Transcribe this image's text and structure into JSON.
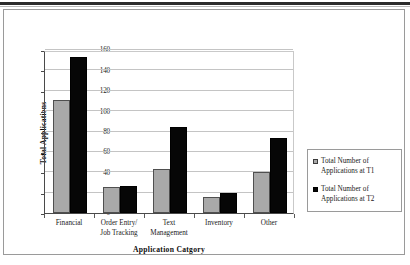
{
  "figure": {
    "y_axis_title": "Total Applications",
    "x_axis_title": "Application Catgory"
  },
  "legend": {
    "items": [
      {
        "label_line1": "Total Number of",
        "label_line2": "Applications at T1",
        "color": "#a9a9a9",
        "series": "T1"
      },
      {
        "label_line1": "Total Number of",
        "label_line2": "Applications at T2",
        "color": "#060606",
        "series": "T2"
      }
    ]
  },
  "axis": {
    "y_ticks": [
      "0",
      "20",
      "40",
      "60",
      "80",
      "100",
      "120",
      "140",
      "160"
    ],
    "x_categories": [
      {
        "line1": "Financial",
        "line2": ""
      },
      {
        "line1": "Order Entry/",
        "line2": "Job Tracking"
      },
      {
        "line1": "Text",
        "line2": "Management"
      },
      {
        "line1": "Inventory",
        "line2": ""
      },
      {
        "line1": "Other",
        "line2": ""
      }
    ]
  },
  "chart_data": {
    "type": "bar",
    "title": "",
    "xlabel": "Application Catgory",
    "ylabel": "Total Applications",
    "ylim": [
      0,
      160
    ],
    "ytick_interval": 20,
    "grid": true,
    "legend_position": "right",
    "categories": [
      "Financial",
      "Order Entry/ Job Tracking",
      "Text Management",
      "Inventory",
      "Other"
    ],
    "series": [
      {
        "name": "Total Number of Applications at T1",
        "color": "#a9a9a9",
        "values": [
          111,
          26,
          43,
          16,
          40
        ]
      },
      {
        "name": "Total Number of Applications at T2",
        "color": "#060606",
        "values": [
          153,
          27,
          84,
          20,
          74
        ]
      }
    ]
  }
}
